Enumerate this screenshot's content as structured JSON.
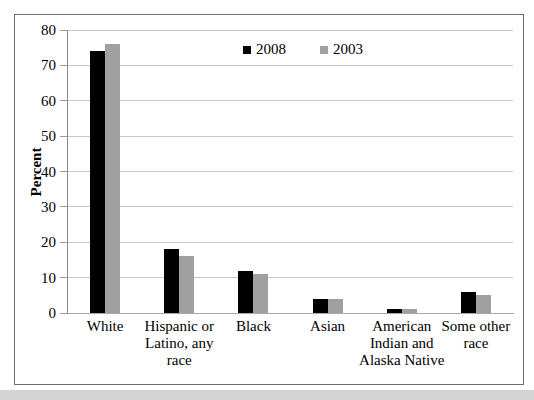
{
  "figure": {
    "background": "#ffffff",
    "frame_border_color": "#6e6e6e",
    "bottom_strip_color": "#d4d4d4",
    "grid_color": "#c6c6c6",
    "yaxis_color": "#8a8a8a",
    "xaxis_color": "#a8a8a8",
    "tick_color": "#9a9a9a"
  },
  "chart_data": {
    "type": "bar",
    "title": "",
    "xlabel": "",
    "ylabel": "Percent",
    "categories": [
      "White",
      "Hispanic or Latino, any race",
      "Black",
      "Asian",
      "American Indian and Alaska Native",
      "Some other race"
    ],
    "series": [
      {
        "name": "2008",
        "color": "#000000",
        "values": [
          74,
          18,
          12,
          4,
          1,
          6
        ]
      },
      {
        "name": "2003",
        "color": "#a0a0a0",
        "values": [
          76,
          16,
          11,
          4,
          1,
          5
        ]
      }
    ],
    "ylim": [
      0,
      80
    ],
    "yticks": [
      0,
      10,
      20,
      30,
      40,
      50,
      60,
      70,
      80
    ],
    "grid": true,
    "legend_position": "top-center-inside",
    "legend": [
      "2008",
      "2003"
    ]
  }
}
